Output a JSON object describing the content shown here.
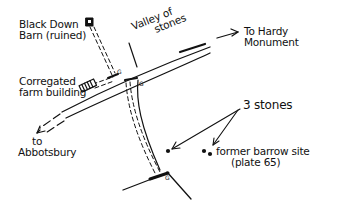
{
  "map": {
    "style": "hand-drawn sketch map",
    "labels": {
      "black_down_barn": [
        "Black Down",
        "Barn (ruined)"
      ],
      "valley_of_stones": [
        "Valley of",
        "stones"
      ],
      "to_hardy_monument": [
        "To Hardy",
        "Monument"
      ],
      "corrugated_farm_building": [
        "Corregated",
        "farm building"
      ],
      "to_abbotsbury": [
        "to",
        "Abbotsbury"
      ],
      "three_stones": "3 stones",
      "former_barrow_site": [
        "former barrow site",
        "(plate 65)"
      ]
    },
    "gate_marker": "G",
    "colors": {
      "ink": "#111111",
      "background": "#ffffff"
    }
  }
}
